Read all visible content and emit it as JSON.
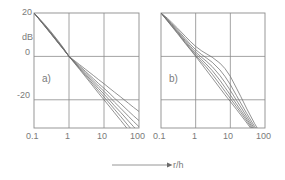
{
  "figure": {
    "caption_axis_label": "r/h",
    "arrow_icon": "right-arrow-icon",
    "background_color": "#ffffff",
    "axis_color": "#8c8c8c",
    "curve_color": "#6e6e6e"
  },
  "chart_data": [
    {
      "type": "line",
      "panel_label": "a)",
      "title": "",
      "xlabel": "r/h",
      "ylabel": "dB",
      "xscale": "log",
      "xlim": [
        0.1,
        100
      ],
      "ylim": [
        -33,
        20
      ],
      "grid": true,
      "legend": "none",
      "xticks": [
        0.1,
        1,
        10,
        100
      ],
      "xtick_labels": [
        "0.1",
        "1",
        "10",
        "100"
      ],
      "yticks": [
        20,
        0,
        -20
      ],
      "ytick_labels": [
        "20",
        "0",
        "-20"
      ],
      "x": [
        0.1,
        0.15,
        0.2,
        0.3,
        0.5,
        0.7,
        1,
        1.5,
        2,
        3,
        5,
        7,
        10,
        15,
        20,
        30,
        50,
        70,
        100
      ],
      "series": [
        {
          "name": "curve-1",
          "values": [
            20.0,
            16.5,
            14.0,
            10.5,
            6.0,
            3.1,
            0.0,
            -3.5,
            -6.0,
            -9.5,
            -14.0,
            -17.0,
            -20.0,
            -23.5,
            -26.0,
            -29.5,
            -34.0,
            -37.0,
            -40.0
          ]
        },
        {
          "name": "curve-2",
          "values": [
            20.0,
            16.5,
            14.1,
            10.6,
            6.1,
            3.2,
            0.0,
            -3.3,
            -5.6,
            -8.9,
            -13.1,
            -15.9,
            -18.7,
            -22.0,
            -24.4,
            -27.7,
            -32.0,
            -34.8,
            -37.6
          ]
        },
        {
          "name": "curve-3",
          "values": [
            20.0,
            16.6,
            14.2,
            10.7,
            6.2,
            3.3,
            0.0,
            -3.1,
            -5.3,
            -8.3,
            -12.2,
            -14.8,
            -17.4,
            -20.5,
            -22.8,
            -25.8,
            -29.8,
            -32.4,
            -35.0
          ]
        },
        {
          "name": "curve-4",
          "values": [
            20.0,
            16.7,
            14.3,
            10.9,
            6.4,
            3.4,
            0.0,
            -2.9,
            -4.9,
            -7.7,
            -11.3,
            -13.7,
            -16.1,
            -19.0,
            -21.1,
            -23.9,
            -27.6,
            -30.0,
            -32.4
          ]
        },
        {
          "name": "curve-5",
          "values": [
            20.0,
            16.8,
            14.5,
            11.1,
            6.6,
            3.5,
            0.0,
            -2.6,
            -4.4,
            -7.0,
            -10.3,
            -12.5,
            -14.7,
            -17.3,
            -19.3,
            -21.8,
            -25.2,
            -27.4,
            -29.6
          ]
        },
        {
          "name": "curve-6",
          "values": [
            20.0,
            17.0,
            14.8,
            11.5,
            7.0,
            3.8,
            0.0,
            -2.2,
            -3.8,
            -6.0,
            -8.8,
            -10.7,
            -12.6,
            -14.9,
            -16.5,
            -18.7,
            -21.6,
            -23.5,
            -25.4
          ]
        }
      ]
    },
    {
      "type": "line",
      "panel_label": "b)",
      "title": "",
      "xlabel": "r/h",
      "ylabel": "dB",
      "xscale": "log",
      "xlim": [
        0.1,
        100
      ],
      "ylim": [
        -33,
        20
      ],
      "grid": true,
      "legend": "none",
      "xticks": [
        0.1,
        1,
        10,
        100
      ],
      "xtick_labels": [
        "0.1",
        "1",
        "10",
        "100"
      ],
      "yticks": [
        20,
        0,
        -20
      ],
      "ytick_labels": [
        "20",
        "0",
        "-20"
      ],
      "x": [
        0.1,
        0.15,
        0.2,
        0.3,
        0.5,
        0.7,
        1,
        1.5,
        2,
        3,
        5,
        7,
        10,
        15,
        20,
        30,
        50,
        70,
        100
      ],
      "series": [
        {
          "name": "curve-1",
          "values": [
            20.0,
            16.5,
            14.0,
            10.5,
            6.0,
            3.1,
            0.0,
            -3.6,
            -6.2,
            -9.9,
            -14.6,
            -17.7,
            -20.8,
            -24.4,
            -27.0,
            -30.7,
            -35.5,
            -38.6,
            -41.7
          ]
        },
        {
          "name": "curve-2",
          "values": [
            20.0,
            16.6,
            14.2,
            10.8,
            6.3,
            3.4,
            0.4,
            -2.6,
            -4.8,
            -8.2,
            -12.9,
            -16.1,
            -19.4,
            -23.2,
            -25.9,
            -29.8,
            -34.8,
            -38.0,
            -41.2
          ]
        },
        {
          "name": "curve-3",
          "values": [
            20.0,
            16.8,
            14.5,
            11.2,
            6.8,
            4.0,
            1.1,
            -1.6,
            -3.5,
            -6.5,
            -11.0,
            -14.3,
            -17.8,
            -21.9,
            -24.8,
            -28.9,
            -34.1,
            -37.4,
            -40.7
          ]
        },
        {
          "name": "curve-4",
          "values": [
            20.0,
            17.0,
            14.8,
            11.6,
            7.4,
            4.7,
            2.0,
            -0.5,
            -2.1,
            -4.7,
            -8.8,
            -12.0,
            -15.7,
            -20.2,
            -23.3,
            -27.8,
            -33.3,
            -36.8,
            -40.2
          ]
        },
        {
          "name": "curve-5",
          "values": [
            20.0,
            17.3,
            15.2,
            12.2,
            8.2,
            5.6,
            3.1,
            0.8,
            -0.6,
            -2.7,
            -6.2,
            -9.2,
            -13.0,
            -18.0,
            -21.5,
            -26.4,
            -32.3,
            -36.0,
            -39.6
          ]
        },
        {
          "name": "curve-6",
          "values": [
            20.0,
            17.7,
            15.8,
            13.0,
            9.3,
            6.9,
            4.6,
            2.5,
            1.3,
            -0.4,
            -3.1,
            -5.6,
            -9.2,
            -14.6,
            -18.5,
            -24.2,
            -30.9,
            -35.0,
            -38.8
          ]
        }
      ]
    }
  ]
}
